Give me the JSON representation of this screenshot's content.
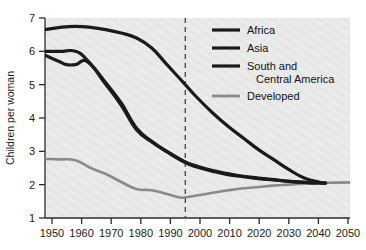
{
  "chart_data": {
    "type": "line",
    "title": "",
    "subtitle": "",
    "xlabel": "",
    "ylabel": "Children per woman",
    "xlim": [
      1950,
      2050
    ],
    "ylim": [
      1,
      7
    ],
    "xticks": [
      1950,
      1960,
      1970,
      1980,
      1990,
      2000,
      2010,
      2020,
      2030,
      2040,
      2050
    ],
    "yticks": [
      1,
      2,
      3,
      4,
      5,
      6,
      7
    ],
    "grid": false,
    "legend_position": "top-right",
    "annotations": [
      {
        "name": "projection-divider",
        "type": "vertical-dashed-line",
        "x": 1996,
        "color": "#4d4d4d"
      }
    ],
    "background_color": "#e9e9e9",
    "series": [
      {
        "name": "Africa",
        "color": "#1a1a1a",
        "width": 3.2,
        "x": [
          1950,
          1955,
          1960,
          1965,
          1970,
          1975,
          1980,
          1985,
          1990,
          1996,
          2000,
          2005,
          2010,
          2015,
          2020,
          2025,
          2030,
          2035,
          2040,
          2042
        ],
        "y": [
          6.65,
          6.72,
          6.75,
          6.72,
          6.65,
          6.55,
          6.4,
          6.1,
          5.6,
          5.0,
          4.6,
          4.15,
          3.75,
          3.4,
          3.05,
          2.75,
          2.45,
          2.2,
          2.07,
          2.05
        ]
      },
      {
        "name": "Asia",
        "color": "#1a1a1a",
        "width": 3.2,
        "x": [
          1950,
          1955,
          1960,
          1964,
          1970,
          1975,
          1980,
          1985,
          1990,
          1996,
          2000,
          2005,
          2010,
          2015,
          2020,
          2025,
          2030,
          2035,
          2040,
          2042
        ],
        "y": [
          6.0,
          6.0,
          6.0,
          5.72,
          5.05,
          4.45,
          3.7,
          3.3,
          3.0,
          2.68,
          2.55,
          2.42,
          2.33,
          2.25,
          2.2,
          2.15,
          2.1,
          2.07,
          2.05,
          2.05
        ]
      },
      {
        "name": "South and Central America",
        "color": "#1a1a1a",
        "width": 3.2,
        "x": [
          1950,
          1955,
          1957,
          1960,
          1964,
          1970,
          1975,
          1980,
          1985,
          1990,
          1996,
          2000,
          2005,
          2010,
          2015,
          2020,
          2025,
          2030,
          2035,
          2040,
          2042
        ],
        "y": [
          5.88,
          5.68,
          5.6,
          5.6,
          5.68,
          5.0,
          4.38,
          3.65,
          3.28,
          2.98,
          2.66,
          2.52,
          2.4,
          2.3,
          2.24,
          2.18,
          2.14,
          2.1,
          2.07,
          2.05,
          2.05
        ]
      },
      {
        "name": "Developed",
        "color": "#8a8a8a",
        "width": 2.6,
        "x": [
          1950,
          1955,
          1960,
          1965,
          1970,
          1975,
          1980,
          1985,
          1990,
          1994,
          1996,
          2000,
          2005,
          2010,
          2015,
          2020,
          2025,
          2030,
          2035,
          2040,
          2045,
          2050
        ],
        "y": [
          2.77,
          2.76,
          2.73,
          2.5,
          2.32,
          2.08,
          1.87,
          1.83,
          1.72,
          1.62,
          1.62,
          1.68,
          1.76,
          1.83,
          1.89,
          1.93,
          1.97,
          2.0,
          2.03,
          2.05,
          2.06,
          2.07
        ]
      }
    ]
  },
  "axes": {
    "y_title": "Children per woman",
    "y_tick_labels": [
      "1",
      "2",
      "3",
      "4",
      "5",
      "6",
      "7"
    ],
    "x_tick_labels": [
      "1950",
      "1960",
      "1970",
      "1980",
      "1990",
      "2000",
      "2010",
      "2020",
      "2030",
      "2040",
      "2050"
    ]
  },
  "legend": {
    "entries": [
      {
        "label": "Africa",
        "color": "#1a1a1a"
      },
      {
        "label": "Asia",
        "color": "#1a1a1a"
      },
      {
        "label": "South and",
        "label2": "Central America",
        "color": "#1a1a1a"
      },
      {
        "label": "Developed",
        "color": "#8a8a8a"
      }
    ]
  }
}
